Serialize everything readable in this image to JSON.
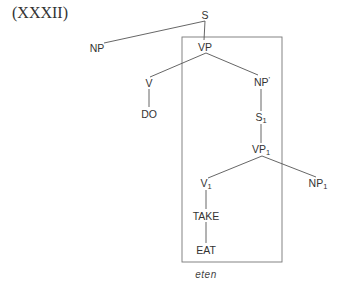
{
  "example_label": "(XXXII)",
  "gloss": "eten",
  "colors": {
    "line": "#555555",
    "text": "#333333",
    "box": "#777777"
  },
  "box": {
    "x1": 182,
    "y1": 37,
    "x2": 282,
    "y2": 262
  },
  "nodes": [
    {
      "id": "S",
      "base": "S",
      "sub": "",
      "prime": "",
      "x": 205,
      "y": 15
    },
    {
      "id": "NP",
      "base": "NP",
      "sub": "",
      "prime": "",
      "x": 97,
      "y": 48
    },
    {
      "id": "VP",
      "base": "VP",
      "sub": "",
      "prime": "",
      "x": 205,
      "y": 47
    },
    {
      "id": "V",
      "base": "V",
      "sub": "",
      "prime": "",
      "x": 149,
      "y": 83
    },
    {
      "id": "NPp",
      "base": "NP",
      "sub": "",
      "prime": "'",
      "x": 262,
      "y": 82
    },
    {
      "id": "DO",
      "base": "DO",
      "sub": "",
      "prime": "",
      "x": 149,
      "y": 114
    },
    {
      "id": "S1",
      "base": "S",
      "sub": "1",
      "prime": "",
      "x": 261,
      "y": 118
    },
    {
      "id": "VP1",
      "base": "VP",
      "sub": "1",
      "prime": "",
      "x": 261,
      "y": 150
    },
    {
      "id": "V1",
      "base": "V",
      "sub": "1",
      "prime": "",
      "x": 206,
      "y": 184
    },
    {
      "id": "NP1",
      "base": "NP",
      "sub": "1",
      "prime": "",
      "x": 318,
      "y": 184
    },
    {
      "id": "TAKE",
      "base": "TAKE",
      "sub": "",
      "prime": "",
      "x": 206,
      "y": 216
    },
    {
      "id": "EAT",
      "base": "EAT",
      "sub": "",
      "prime": "",
      "x": 206,
      "y": 250
    }
  ],
  "edges": [
    {
      "from": [
        205,
        21
      ],
      "to": [
        104,
        43
      ]
    },
    {
      "from": [
        205,
        21
      ],
      "to": [
        204,
        40
      ]
    },
    {
      "from": [
        206,
        53
      ],
      "to": [
        150,
        77
      ]
    },
    {
      "from": [
        206,
        53
      ],
      "to": [
        258,
        75
      ]
    },
    {
      "from": [
        149,
        89
      ],
      "to": [
        149,
        107
      ]
    },
    {
      "from": [
        261,
        89
      ],
      "to": [
        261,
        111
      ]
    },
    {
      "from": [
        261,
        124
      ],
      "to": [
        261,
        143
      ]
    },
    {
      "from": [
        262,
        156
      ],
      "to": [
        208,
        178
      ]
    },
    {
      "from": [
        262,
        156
      ],
      "to": [
        316,
        177
      ]
    },
    {
      "from": [
        206,
        190
      ],
      "to": [
        206,
        209
      ]
    },
    {
      "from": [
        206,
        222
      ],
      "to": [
        206,
        243
      ]
    }
  ]
}
